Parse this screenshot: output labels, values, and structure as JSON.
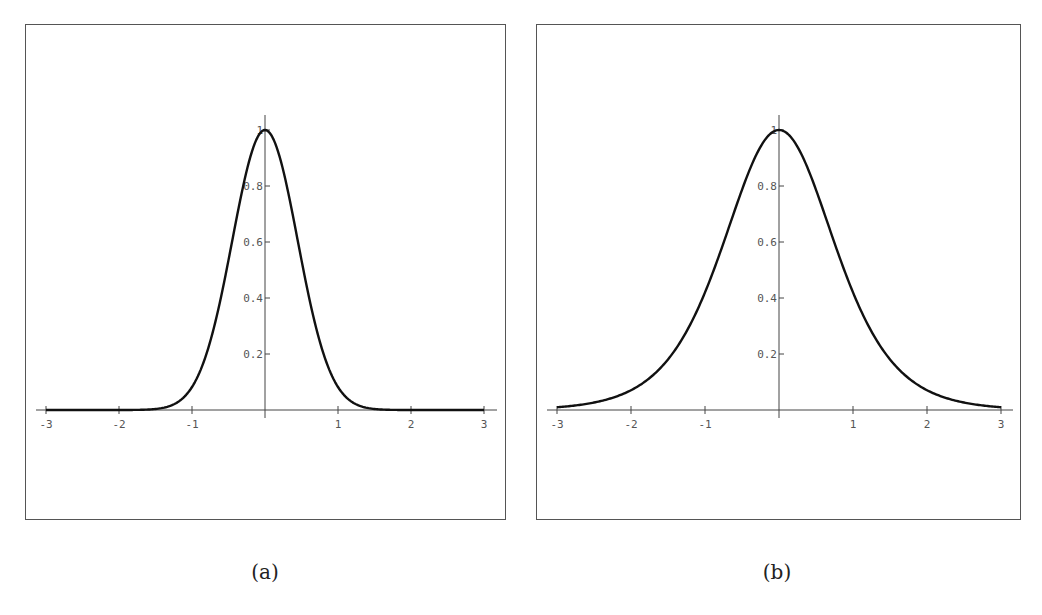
{
  "figure": {
    "captions": [
      "(a)",
      "(b)"
    ]
  },
  "chart_data": [
    {
      "type": "line",
      "panel": "a",
      "title": "",
      "xlabel": "",
      "ylabel": "",
      "xlim": [
        -3,
        3
      ],
      "ylim": [
        0,
        1
      ],
      "grid": false,
      "legend": null,
      "x_ticks": [
        "-3",
        "-2",
        "-1",
        "1",
        "2",
        "3"
      ],
      "x_tick_values": [
        -3,
        -2,
        -1,
        1,
        2,
        3
      ],
      "y_ticks": [
        "0.2",
        "0.4",
        "0.6",
        "0.8",
        "1"
      ],
      "y_tick_values": [
        0.2,
        0.4,
        0.6,
        0.8,
        1.0
      ],
      "function_estimate": "exp(-2.5 x^2)",
      "x": [
        -3,
        -2.5,
        -2,
        -1.5,
        -1.25,
        -1,
        -0.75,
        -0.5,
        -0.25,
        0,
        0.25,
        0.5,
        0.75,
        1,
        1.25,
        1.5,
        2,
        2.5,
        3
      ],
      "values": [
        0.0,
        0.0,
        0.0,
        0.004,
        0.02,
        0.08,
        0.25,
        0.54,
        0.86,
        1.0,
        0.86,
        0.54,
        0.25,
        0.08,
        0.02,
        0.004,
        0.0,
        0.0,
        0.0
      ],
      "stroke_color": "#111111"
    },
    {
      "type": "line",
      "panel": "b",
      "title": "",
      "xlabel": "",
      "ylabel": "",
      "xlim": [
        -3,
        3
      ],
      "ylim": [
        0,
        1
      ],
      "grid": false,
      "legend": null,
      "x_ticks": [
        "-3",
        "-2",
        "-1",
        "1",
        "2",
        "3"
      ],
      "x_tick_values": [
        -3,
        -2,
        -1,
        1,
        2,
        3
      ],
      "y_ticks": [
        "0.2",
        "0.4",
        "0.6",
        "0.8",
        "1"
      ],
      "y_tick_values": [
        0.2,
        0.4,
        0.6,
        0.8,
        1.0
      ],
      "function_estimate": "sech^2(x)",
      "x": [
        -3,
        -2.5,
        -2,
        -1.5,
        -1.25,
        -1,
        -0.75,
        -0.5,
        -0.25,
        0,
        0.25,
        0.5,
        0.75,
        1,
        1.25,
        1.5,
        2,
        2.5,
        3
      ],
      "values": [
        0.01,
        0.03,
        0.07,
        0.18,
        0.28,
        0.42,
        0.6,
        0.79,
        0.94,
        1.0,
        0.94,
        0.79,
        0.6,
        0.42,
        0.28,
        0.18,
        0.07,
        0.03,
        0.01
      ],
      "stroke_color": "#111111"
    }
  ]
}
